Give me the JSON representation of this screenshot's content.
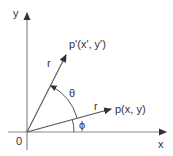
{
  "diagram": {
    "type": "2D rotation of a point about the origin",
    "colors": {
      "axis": "#8a8a8a",
      "vector": "#555555",
      "text": "#333333"
    },
    "axes": {
      "x_label": "x",
      "y_label": "y",
      "origin_label": "0"
    },
    "vectors": [
      {
        "id": "original",
        "label": "p(x, y)",
        "length_label": "r"
      },
      {
        "id": "rotated",
        "label": "p'(x', y')",
        "length_label": "r"
      }
    ],
    "angles": [
      {
        "id": "rotation",
        "symbol": "θ",
        "from": "p(x, y)",
        "to": "p'(x', y')"
      },
      {
        "id": "initial",
        "symbol": "ϕ",
        "from": "x-axis",
        "to": "p(x, y)"
      }
    ]
  }
}
